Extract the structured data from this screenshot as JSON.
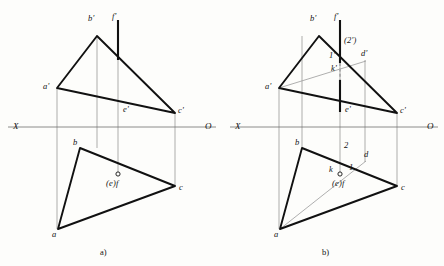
{
  "figure": {
    "background_color": "#fdfdfb",
    "stroke_color": "#111111",
    "thin_color": "#7a7a7a",
    "captions": [
      {
        "text": "a)",
        "x": 100,
        "y": 247
      },
      {
        "text": "b)",
        "x": 322,
        "y": 247
      }
    ],
    "panels": [
      {
        "id": "panel-a",
        "caption": "a)",
        "axis": {
          "left_label": "X",
          "right_label": "O",
          "y": 127,
          "x_start": 8,
          "x_end": 216,
          "left_label_x": 13,
          "right_label_x": 205
        },
        "labels": [
          {
            "name": "b-prime",
            "text": "b'",
            "x": 88,
            "y": 20
          },
          {
            "name": "f-prime",
            "text": "f'",
            "x": 113,
            "y": 18
          },
          {
            "name": "a-prime",
            "text": "a'",
            "x": 44,
            "y": 81
          },
          {
            "name": "c-prime",
            "text": "c'",
            "x": 179,
            "y": 106
          },
          {
            "name": "e-prime",
            "text": "e'",
            "x": 124,
            "y": 110
          },
          {
            "name": "b-low",
            "text": "b",
            "x": 73,
            "y": 140
          },
          {
            "name": "c-low",
            "text": "c",
            "x": 180,
            "y": 184
          },
          {
            "name": "a-low",
            "text": "a",
            "x": 53,
            "y": 232
          },
          {
            "name": "ef-low",
            "text": "(e)f",
            "x": 107,
            "y": 184
          }
        ]
      },
      {
        "id": "panel-b",
        "caption": "b)",
        "axis": {
          "left_label": "X",
          "right_label": "O",
          "y": 127,
          "x_start": 230,
          "x_end": 438,
          "left_label_x": 235,
          "right_label_x": 427
        },
        "labels": [
          {
            "name": "b-prime",
            "text": "b'",
            "x": 310,
            "y": 20
          },
          {
            "name": "f-prime",
            "text": "f'",
            "x": 335,
            "y": 18
          },
          {
            "name": "two-prime",
            "text": "(2')",
            "x": 345,
            "y": 40
          },
          {
            "name": "one-prime",
            "text": "1'",
            "x": 330,
            "y": 55
          },
          {
            "name": "d-prime",
            "text": "d'",
            "x": 362,
            "y": 53
          },
          {
            "name": "k-prime",
            "text": "k'",
            "x": 336,
            "y": 70
          },
          {
            "name": "a-prime",
            "text": "a'",
            "x": 266,
            "y": 81
          },
          {
            "name": "c-prime",
            "text": "c'",
            "x": 401,
            "y": 106
          },
          {
            "name": "e-prime",
            "text": "e'",
            "x": 346,
            "y": 110
          },
          {
            "name": "b-low",
            "text": "b",
            "x": 295,
            "y": 140
          },
          {
            "name": "two-low",
            "text": "2",
            "x": 345,
            "y": 145
          },
          {
            "name": "d-low",
            "text": "d",
            "x": 365,
            "y": 154
          },
          {
            "name": "k-low",
            "text": "k",
            "x": 330,
            "y": 168
          },
          {
            "name": "one-low",
            "text": "1",
            "x": 350,
            "y": 166
          },
          {
            "name": "ef-low",
            "text": "(e)f",
            "x": 333,
            "y": 184
          },
          {
            "name": "c-low",
            "text": "c",
            "x": 402,
            "y": 184
          },
          {
            "name": "a-low",
            "text": "a",
            "x": 275,
            "y": 232
          }
        ]
      }
    ],
    "geometry": {
      "panel_a": {
        "vertical_projectors": [
          {
            "x": 57,
            "y1": 88,
            "y2": 229
          },
          {
            "x": 97,
            "y1": 36,
            "y2": 148
          },
          {
            "x": 118,
            "y1": 60,
            "y2": 177
          },
          {
            "x": 175,
            "y1": 113,
            "y2": 186
          }
        ],
        "upper_triangle": [
          [
            97,
            36
          ],
          [
            57,
            88
          ],
          [
            175,
            113
          ]
        ],
        "lower_triangle": [
          [
            80,
            148
          ],
          [
            58,
            229
          ],
          [
            175,
            186
          ]
        ],
        "thick_vertical": {
          "x": 118,
          "y1": 20,
          "y2": 60
        },
        "point_marker": {
          "x": 118,
          "y": 174,
          "r": 2.1
        }
      },
      "panel_b": {
        "vertical_projectors": [
          {
            "x": 279,
            "y1": 88,
            "y2": 229
          },
          {
            "x": 302,
            "y1": 36,
            "y2": 148
          },
          {
            "x": 340,
            "y1": 60,
            "y2": 177
          },
          {
            "x": 365,
            "y1": 60,
            "y2": 162
          },
          {
            "x": 397,
            "y1": 113,
            "y2": 186
          }
        ],
        "upper_triangle": [
          [
            319,
            36
          ],
          [
            279,
            88
          ],
          [
            397,
            113
          ]
        ],
        "lower_triangle": [
          [
            302,
            148
          ],
          [
            280,
            229
          ],
          [
            397,
            186
          ]
        ],
        "thick_vertical_solid_top": {
          "x": 340,
          "y1": 20,
          "y2": 62
        },
        "thick_vertical_dashed": {
          "x": 340,
          "y1": 62,
          "y2": 80
        },
        "thick_vertical_solid_bot": {
          "x": 340,
          "y1": 80,
          "y2": 112
        },
        "construction_upper": {
          "x1": 279,
          "y1": 88,
          "x2": 365,
          "y2": 62
        },
        "construction_lower": {
          "x1": 280,
          "y1": 229,
          "x2": 365,
          "y2": 162
        },
        "point_marker": {
          "x": 340,
          "y": 174,
          "r": 2.1
        }
      }
    }
  }
}
